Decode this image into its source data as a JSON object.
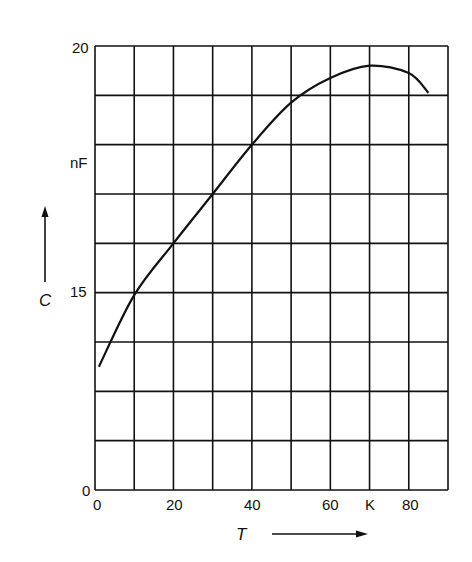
{
  "chart_data": {
    "type": "line",
    "title": "",
    "xlabel": "T",
    "xunit": "K",
    "ylabel": "C",
    "yunit": "nF",
    "xlim": [
      0,
      90
    ],
    "ylim_display": [
      0,
      20
    ],
    "y_axis_break": "axis jumps from 0 (bottom) to 15 at the 5th gridline; 1 nF per grid row above 15",
    "grid": true,
    "x_ticks": [
      {
        "value": 0,
        "label": "0"
      },
      {
        "value": 20,
        "label": "20"
      },
      {
        "value": 40,
        "label": "40"
      },
      {
        "value": 60,
        "label": "60"
      },
      {
        "value": 70,
        "label": "K"
      },
      {
        "value": 80,
        "label": "80"
      }
    ],
    "y_ticks": [
      {
        "value": 0,
        "label": "0"
      },
      {
        "value": 15,
        "label": "15"
      },
      {
        "value": 18,
        "label": "nF"
      },
      {
        "value": 20,
        "label": "20"
      }
    ],
    "series": [
      {
        "name": "C(T)",
        "x": [
          1,
          10,
          20,
          30,
          40,
          50,
          60,
          70,
          80,
          85
        ],
        "y": [
          13.5,
          14.95,
          16.0,
          17.0,
          18.0,
          18.85,
          19.35,
          19.6,
          19.45,
          19.05
        ]
      }
    ]
  },
  "labels": {
    "y_top": "20",
    "y_unit": "nF",
    "y_mid": "15",
    "y_bottom": "0",
    "y_axis_symbol": "C",
    "x_axis_symbol": "T",
    "x_0": "0",
    "x_20": "20",
    "x_40": "40",
    "x_60": "60",
    "x_unit": "K",
    "x_80": "80"
  }
}
